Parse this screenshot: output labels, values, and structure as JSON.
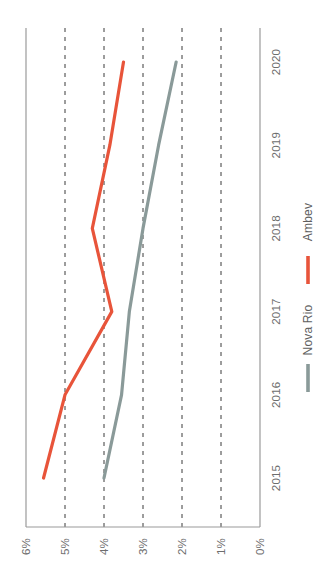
{
  "chart_data": {
    "type": "line",
    "title": "",
    "subtitle": "",
    "orientation": "rotated-90",
    "xlabel": "",
    "ylabel": "",
    "categories": [
      "2015",
      "2016",
      "2017",
      "2018",
      "2019",
      "2020"
    ],
    "value_ticks": [
      "6%",
      "5%",
      "4%",
      "3%",
      "2%",
      "1%",
      "0%"
    ],
    "value_tick_numbers": [
      6,
      5,
      4,
      3,
      2,
      1,
      0
    ],
    "ylim": [
      0,
      6
    ],
    "grid": "dashed-vertical-at-value-ticks",
    "legend_position": "right",
    "series": [
      {
        "name": "Nova Rio",
        "color": "#8a9a99",
        "values": [
          4.0,
          3.55,
          3.35,
          3.0,
          2.6,
          2.15
        ]
      },
      {
        "name": "Ambev",
        "color": "#e8543a",
        "values": [
          5.55,
          5.0,
          3.8,
          4.3,
          3.85,
          3.5
        ]
      }
    ]
  },
  "legend": {
    "items": [
      {
        "label": "Nova Rio",
        "color": "#8a9a99"
      },
      {
        "label": "Ambev",
        "color": "#e8543a"
      }
    ]
  },
  "axis": {
    "value_labels": [
      "6%",
      "5%",
      "4%",
      "3%",
      "2%",
      "1%",
      "0%"
    ],
    "category_labels": [
      "2015",
      "2016",
      "2017",
      "2018",
      "2019",
      "2020"
    ]
  }
}
